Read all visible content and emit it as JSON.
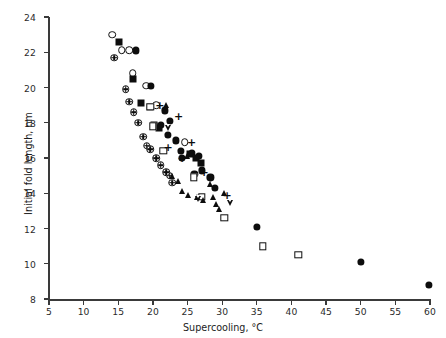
{
  "figure": {
    "background": "#ffffff",
    "marker_color": "#0d0d0d",
    "axis_color": "#3a3a3a"
  },
  "chart_data": {
    "type": "scatter",
    "title": "",
    "xlabel": "Supercooling, °C",
    "ylabel": "Initial fold length, nm",
    "xlim": [
      5,
      60
    ],
    "ylim": [
      8,
      24
    ],
    "xticks": [
      5,
      10,
      15,
      20,
      25,
      30,
      35,
      40,
      45,
      50,
      55,
      60
    ],
    "yticks": [
      8,
      10,
      12,
      14,
      16,
      18,
      20,
      22,
      24
    ],
    "xtick_labels": [
      "5",
      "10",
      "15",
      "20",
      "25",
      "30",
      "35",
      "40",
      "45",
      "50",
      "55",
      "60"
    ],
    "ytick_labels": [
      "8",
      "10",
      "12",
      "14",
      "16",
      "18",
      "20",
      "22",
      "24"
    ],
    "grid": false,
    "legend": "none",
    "series": [
      {
        "name": "open-circle",
        "marker": "open-circle",
        "points": [
          [
            14.1,
            23.0
          ],
          [
            15.5,
            22.1
          ],
          [
            16.6,
            22.1
          ],
          [
            17.1,
            20.8
          ],
          [
            19.0,
            20.1
          ],
          [
            20.5,
            19.0
          ],
          [
            24.6,
            16.9
          ]
        ]
      },
      {
        "name": "filled-circle",
        "marker": "filled-circle",
        "points": [
          [
            17.6,
            22.1
          ],
          [
            19.7,
            20.1
          ],
          [
            21.7,
            18.7
          ],
          [
            22.4,
            18.1
          ],
          [
            21.1,
            17.9
          ],
          [
            22.2,
            17.3
          ],
          [
            24.0,
            16.4
          ],
          [
            25.6,
            16.3
          ],
          [
            26.6,
            16.1
          ],
          [
            27.1,
            15.3
          ],
          [
            24.2,
            16.0
          ],
          [
            28.3,
            14.9
          ],
          [
            26.0,
            15.1
          ],
          [
            35.0,
            12.1
          ],
          [
            50.0,
            10.1
          ],
          [
            59.8,
            8.8
          ],
          [
            28.9,
            14.3
          ],
          [
            23.3,
            17.0
          ]
        ]
      },
      {
        "name": "crossed-circle",
        "marker": "crossed-circle",
        "points": [
          [
            14.4,
            21.7
          ],
          [
            16.1,
            19.9
          ],
          [
            16.6,
            19.2
          ],
          [
            17.9,
            18.0
          ],
          [
            18.6,
            17.2
          ],
          [
            19.1,
            16.7
          ],
          [
            20.5,
            16.0
          ],
          [
            21.1,
            15.6
          ],
          [
            22.4,
            15.0
          ],
          [
            22.8,
            14.6
          ],
          [
            17.2,
            18.6
          ],
          [
            19.6,
            16.5
          ],
          [
            21.9,
            15.2
          ]
        ]
      },
      {
        "name": "filled-square",
        "marker": "filled-square",
        "points": [
          [
            15.1,
            22.6
          ],
          [
            17.1,
            20.5
          ],
          [
            18.3,
            19.1
          ],
          [
            19.6,
            18.9
          ],
          [
            20.2,
            17.9
          ],
          [
            20.9,
            17.7
          ],
          [
            25.3,
            16.2
          ],
          [
            26.2,
            16.0
          ],
          [
            26.9,
            15.7
          ],
          [
            20.1,
            17.8
          ]
        ]
      },
      {
        "name": "open-square",
        "marker": "open-square",
        "points": [
          [
            20.0,
            17.8
          ],
          [
            21.5,
            16.4
          ],
          [
            25.9,
            14.9
          ],
          [
            27.1,
            13.8
          ],
          [
            30.3,
            12.6
          ],
          [
            35.9,
            11.0
          ],
          [
            41.0,
            10.5
          ],
          [
            19.6,
            18.9
          ]
        ]
      },
      {
        "name": "filled-triangle",
        "marker": "filled-triangle",
        "points": [
          [
            22.7,
            15.0
          ],
          [
            23.6,
            14.7
          ],
          [
            24.2,
            14.1
          ],
          [
            25.0,
            13.9
          ],
          [
            26.4,
            13.8
          ],
          [
            27.3,
            13.6
          ],
          [
            28.3,
            14.5
          ],
          [
            28.7,
            13.8
          ],
          [
            29.1,
            13.4
          ],
          [
            29.6,
            13.1
          ],
          [
            21.9,
            19.0
          ],
          [
            24.9,
            16.1
          ],
          [
            30.2,
            14.0
          ]
        ]
      },
      {
        "name": "open-down-triangle",
        "marker": "open-down-triangle",
        "points": [
          [
            26.5,
            13.7
          ],
          [
            31.1,
            13.8
          ],
          [
            22.2,
            18.4
          ]
        ]
      },
      {
        "name": "plus",
        "marker": "plus",
        "points": [
          [
            21.0,
            19.0
          ],
          [
            23.7,
            18.4
          ],
          [
            24.2,
            16.0
          ],
          [
            25.6,
            16.9
          ],
          [
            27.4,
            15.2
          ],
          [
            30.7,
            13.9
          ],
          [
            22.2,
            16.6
          ]
        ]
      }
    ]
  }
}
